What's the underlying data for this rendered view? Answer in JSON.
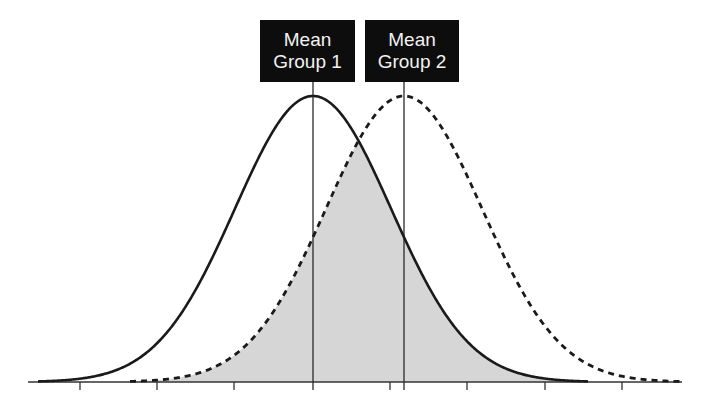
{
  "chart_data": {
    "type": "area",
    "title": "",
    "xlabel": "",
    "ylabel": "",
    "grid": false,
    "series": [
      {
        "name": "Group 1",
        "style": "solid",
        "mean_sd_units": 0.0,
        "sd": 1.0
      },
      {
        "name": "Group 2",
        "style": "dashed",
        "mean_sd_units": 1.17,
        "sd": 1.0
      }
    ],
    "x_ticks_sd": [
      -3,
      -2,
      -1,
      0,
      1,
      2,
      3,
      4
    ],
    "tick_labels": [],
    "overlap_shaded": true,
    "overlap_color": "#d6d6d6",
    "annotations": [
      {
        "text": "Mean Group 1",
        "line1": "Mean",
        "line2": "Group 1",
        "at_series": "Group 1"
      },
      {
        "text": "Mean Group 2",
        "line1": "Mean",
        "line2": "Group 2",
        "at_series": "Group 2"
      }
    ]
  },
  "labels": {
    "mean1": {
      "line1": "Mean",
      "line2": "Group 1"
    },
    "mean2": {
      "line1": "Mean",
      "line2": "Group 2"
    }
  },
  "layout": {
    "baseline_y": 382,
    "axis_x0": 28,
    "axis_x1": 682,
    "mean1_x": 313,
    "mean2_x": 404,
    "sigma_px": 78,
    "peak_px": 286,
    "solid_range": [
      38,
      588
    ],
    "dashed_range": [
      130,
      682
    ],
    "ticks_x": [
      80,
      157,
      234,
      390,
      467,
      545,
      622
    ],
    "line_color": "#1a1a1a",
    "mean_line_color": "#2a2a2a"
  }
}
